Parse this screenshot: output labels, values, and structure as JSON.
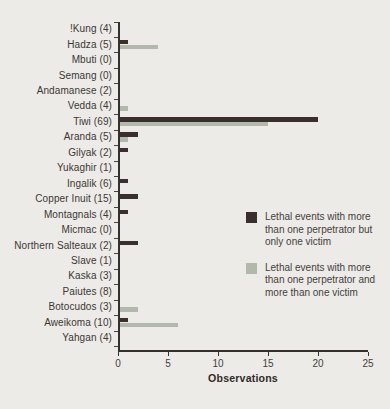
{
  "figure": {
    "background": "#edebe7",
    "axis_color": "#35302d",
    "text_color": "#3b3734"
  },
  "chart_data": {
    "type": "bar",
    "orientation": "horizontal",
    "title": "",
    "xlabel": "Observations",
    "xlim": [
      0,
      25
    ],
    "xticks": [
      0,
      5,
      10,
      15,
      20,
      25
    ],
    "grid": false,
    "legend_position": "right-middle",
    "categories": [
      "!Kung (4)",
      "Hadza (5)",
      "Mbuti (0)",
      "Semang (0)",
      "Andamanese (2)",
      "Vedda (4)",
      "Tiwi (69)",
      "Aranda (5)",
      "Gilyak (2)",
      "Yukaghir (1)",
      "Ingalik (6)",
      "Copper Inuit (15)",
      "Montagnals (4)",
      "Micmac (0)",
      "Northern Salteaux (2)",
      "Slave (1)",
      "Kaska (3)",
      "Paiutes (8)",
      "Botocudos (3)",
      "Aweikoma (10)",
      "Yahgan (4)"
    ],
    "series": [
      {
        "name": "Lethal events with more than one perpetrator but only one victim",
        "color": "#3a2f2d",
        "values": [
          0,
          1,
          0,
          0,
          0,
          0,
          20,
          2,
          1,
          0,
          1,
          2,
          1,
          0,
          2,
          0,
          0,
          0,
          0,
          1,
          0
        ]
      },
      {
        "name": "Lethal events with more than one perpetrator and more than one victim",
        "color": "#b3b8ac",
        "values": [
          0,
          4,
          0,
          0,
          0,
          1,
          15,
          1,
          0,
          0,
          0,
          0,
          0,
          0,
          0,
          0,
          0,
          0,
          2,
          6,
          0
        ]
      }
    ]
  }
}
